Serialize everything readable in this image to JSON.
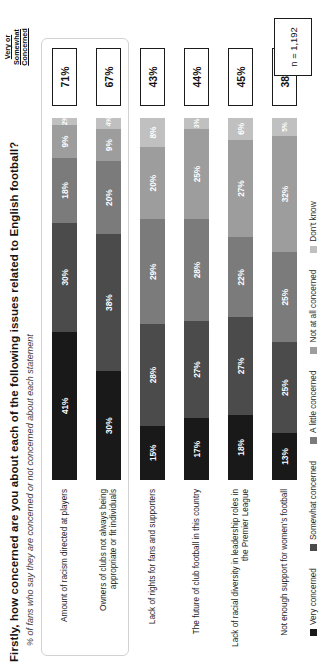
{
  "chart_data": {
    "type": "bar",
    "title": "Firstly, how concerned are you about each of the following issues related to English football?",
    "subtitle": "% of fans who say they are concerned or not concerned about each statement",
    "xlabel": "",
    "ylabel": "",
    "grid": false,
    "legend_position": "bottom",
    "stacked": true,
    "orientation": "horizontal",
    "base_note": "n = 1,192",
    "summary_column_header": "Very or Somewhat Concerned",
    "categories": [
      "Amount of racism directed at players",
      "Owners of clubs not always being appropriate or fit individuals",
      "Lack of rights for fans and supporters",
      "The future of club football in this country",
      "Lack of racial diversity in leadership roles in the Premier League",
      "Not enough support for women's football"
    ],
    "series": [
      {
        "name": "Very concerned",
        "color": "#191919",
        "values": [
          41,
          30,
          15,
          17,
          18,
          13
        ]
      },
      {
        "name": "Somewhat concerned",
        "color": "#4b4b4b",
        "values": [
          30,
          38,
          28,
          27,
          27,
          25
        ]
      },
      {
        "name": "A little concerned",
        "color": "#7b7b7b",
        "values": [
          18,
          20,
          29,
          28,
          22,
          25
        ]
      },
      {
        "name": "Not at all concerned",
        "color": "#9d9d9d",
        "values": [
          9,
          9,
          20,
          25,
          27,
          32
        ]
      },
      {
        "name": "Don't know",
        "color": "#c0c0c0",
        "values": [
          2,
          4,
          8,
          3,
          6,
          5
        ]
      }
    ],
    "summary_values": [
      "71%",
      "67%",
      "43%",
      "44%",
      "45%",
      "38%"
    ],
    "value_labels": [
      [
        "41%",
        "30%",
        "18%",
        "9%",
        "2%"
      ],
      [
        "30%",
        "38%",
        "20%",
        "9%",
        "4%"
      ],
      [
        "15%",
        "28%",
        "29%",
        "20%",
        "8%"
      ],
      [
        "17%",
        "27%",
        "28%",
        "25%",
        "3%"
      ],
      [
        "18%",
        "27%",
        "22%",
        "27%",
        "6%"
      ],
      [
        "13%",
        "25%",
        "25%",
        "32%",
        "5%"
      ]
    ],
    "highlight_group": {
      "rows": [
        0,
        1
      ]
    }
  },
  "header": {
    "summary_line1": "Very or",
    "summary_line2": "Somewhat",
    "summary_line3": "Concerned"
  },
  "footer": {
    "n_label": "n = 1,192"
  }
}
